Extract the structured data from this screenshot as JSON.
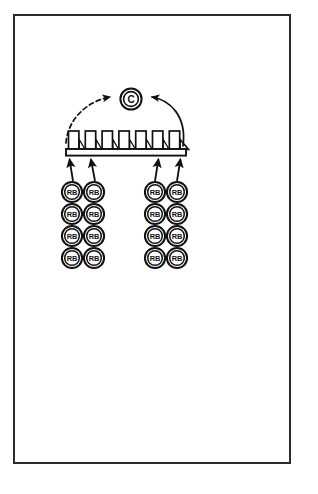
{
  "page": {
    "background_color": "#ffffff",
    "frame_color": "#2b2b2b",
    "ink_color": "#111111"
  },
  "diagram": {
    "type": "process-flow-schematic",
    "nodes": {
      "central": {
        "label": "C",
        "shape": "double-circle",
        "name": "capper-node",
        "cx": 131,
        "cy": 99,
        "outer_r": 11,
        "inner_r": 7.6
      },
      "conveyor": {
        "name": "conveyor-rail",
        "x": 66,
        "y": 149,
        "width": 117,
        "height": 7,
        "box_count": 7,
        "end_wedge": true
      },
      "unit_label": "RB",
      "unit_groups": [
        {
          "name": "left-unit-group",
          "columns": 2,
          "rows": 4,
          "origin_x": 72,
          "origin_y": 192,
          "col_gap": 22,
          "row_gap": 22,
          "radius": 10.2
        },
        {
          "name": "right-unit-group",
          "columns": 2,
          "rows": 4,
          "origin_x": 155,
          "origin_y": 192,
          "col_gap": 22,
          "row_gap": 22,
          "radius": 10.2
        }
      ]
    },
    "feed_arrows": [
      {
        "name": "feed-arrow-1",
        "x1": 72,
        "y1": 180,
        "x2": 69,
        "y2": 158
      },
      {
        "name": "feed-arrow-2",
        "x1": 94,
        "y1": 180,
        "x2": 90,
        "y2": 158
      },
      {
        "name": "feed-arrow-3",
        "x1": 155,
        "y1": 180,
        "x2": 158,
        "y2": 158
      },
      {
        "name": "feed-arrow-4",
        "x1": 177,
        "y1": 180,
        "x2": 180,
        "y2": 158
      }
    ],
    "flow_arrows": [
      {
        "name": "dashed-return-arrow",
        "style": "dashed",
        "direction": "left-to-center",
        "path": "M 66 143 C 68 118, 88 101, 110 97"
      },
      {
        "name": "solid-return-arrow",
        "style": "solid",
        "direction": "right-to-center",
        "path": "M 183 146 C 186 117, 170 100, 152 97"
      }
    ]
  }
}
